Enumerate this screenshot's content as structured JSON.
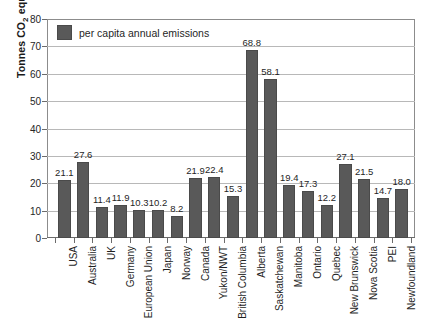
{
  "title_sliver": "",
  "legend": {
    "label": "per capita annual emissions",
    "swatch_color": "#595959"
  },
  "axes": {
    "ylabel_prefix": "Tonnes CO",
    "ylabel_sub": "2",
    "ylabel_suffix": " equivalents",
    "yticks": [
      0,
      10,
      20,
      30,
      40,
      50,
      60,
      70,
      80
    ]
  },
  "chart_data": {
    "type": "bar",
    "title": "",
    "xlabel": "",
    "ylabel": "Tonnes CO2 equivalents",
    "ylim": [
      0,
      80
    ],
    "ytick_step": 10,
    "grid": true,
    "legend_position": "top-left",
    "series_name": "per capita annual emissions",
    "bar_color": "#595959",
    "categories": [
      "USA",
      "Australia",
      "UK",
      "Germany",
      "European Union",
      "Japan",
      "Norway",
      "Canada",
      "Yukon/NWT",
      "British Columbia",
      "Alberta",
      "Saskatchewan",
      "Manitoba",
      "Ontario",
      "Quebec",
      "New Brunswick",
      "Nova Scotia",
      "PEI",
      "Newfoundland"
    ],
    "values": [
      21.1,
      27.6,
      11.4,
      11.9,
      10.3,
      10.2,
      8.2,
      21.9,
      22.4,
      15.3,
      68.8,
      58.1,
      19.4,
      17.3,
      12.2,
      27.1,
      21.5,
      14.7,
      18.0
    ],
    "value_labels": [
      "21.1",
      "27.6",
      "11.4",
      "11.9",
      "10.3",
      "10.2",
      "8.2",
      "21.9",
      "22.4",
      "15.3",
      "68.8",
      "58.1",
      "19.4",
      "17.3",
      "12.2",
      "27.1",
      "21.5",
      "14.7",
      "18.0"
    ]
  }
}
